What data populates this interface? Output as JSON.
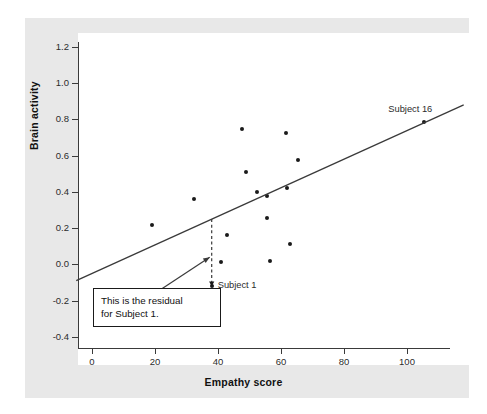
{
  "chart_data": {
    "type": "scatter",
    "title": "",
    "xlabel": "Empathy score",
    "ylabel": "Brain activity",
    "xlim": [
      -5,
      118
    ],
    "ylim": [
      -0.52,
      1.31
    ],
    "xticks": [
      "0",
      "20",
      "40",
      "60",
      "80",
      "100"
    ],
    "xtick_values": [
      0,
      20,
      40,
      60,
      80,
      100
    ],
    "yticks": [
      "1.2",
      "1.0",
      "0.8",
      "0.6",
      "0.4",
      "0.2",
      "0.0",
      "-0.2",
      "-0.4"
    ],
    "ytick_values": [
      1.2,
      1.0,
      0.8,
      0.6,
      0.4,
      0.2,
      0.0,
      -0.2,
      -0.4
    ],
    "grid": false,
    "legend": "none",
    "points": [
      {
        "x": 19.0,
        "y": 0.215
      },
      {
        "x": 32.5,
        "y": 0.36
      },
      {
        "x": 38.0,
        "y": -0.12,
        "label": "Subject 1"
      },
      {
        "x": 41.0,
        "y": 0.015
      },
      {
        "x": 43.0,
        "y": 0.16
      },
      {
        "x": 47.5,
        "y": 0.745
      },
      {
        "x": 49.0,
        "y": 0.51
      },
      {
        "x": 52.5,
        "y": 0.4
      },
      {
        "x": 55.5,
        "y": 0.375
      },
      {
        "x": 55.5,
        "y": 0.255
      },
      {
        "x": 56.5,
        "y": 0.02
      },
      {
        "x": 61.5,
        "y": 0.725
      },
      {
        "x": 62.0,
        "y": 0.42
      },
      {
        "x": 63.0,
        "y": 0.115
      },
      {
        "x": 65.5,
        "y": 0.575
      },
      {
        "x": 105.5,
        "y": 0.785,
        "label": "Subject 16"
      }
    ],
    "regression_line": {
      "x_start": -5,
      "y_start": -0.09,
      "x_end": 118,
      "y_end": 0.88
    },
    "residual_segment": {
      "x": 38.0,
      "y_fitted": 0.25,
      "y_observed": -0.12,
      "style": "dashed"
    },
    "annotations": [
      {
        "name": "residual-callout",
        "text_line1": "This is the residual",
        "text_line2": "for Subject 1.",
        "points_to_x": 38.0,
        "points_to_y": 0.04
      },
      {
        "name": "subject-1-label",
        "text": "Subject 1"
      },
      {
        "name": "subject-16-label",
        "text": "Subject 16"
      }
    ],
    "colors": {
      "point": "#1a1a1a",
      "line": "#3a3a3a",
      "axis": "#3a3a3a",
      "panel": "#ffffff",
      "card": "#e8e8e8",
      "text": "#2b2b2b"
    }
  }
}
